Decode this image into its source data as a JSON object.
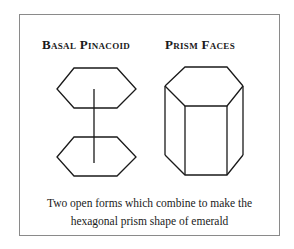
{
  "headings": {
    "left": "Basal Pinacoid",
    "right": "Prism Faces"
  },
  "caption": {
    "line1": "Two open forms which combine to make the",
    "line2": "hexagonal prism shape of emerald"
  },
  "colors": {
    "line": "#1a1a1a",
    "frame": "#8a8a8a"
  }
}
